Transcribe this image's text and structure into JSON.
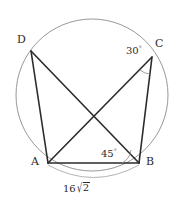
{
  "figure": {
    "stroke_color": "#2b2b2b",
    "circle_color": "#999999",
    "dimension_color": "#aaaaaa",
    "background": "#ffffff"
  },
  "vertices": {
    "a": {
      "label": "A",
      "x": 48,
      "y": 163,
      "label_x": 31,
      "label_y": 162
    },
    "b": {
      "label": "B",
      "x": 139,
      "y": 163,
      "label_x": 146,
      "label_y": 162
    },
    "c": {
      "label": "C",
      "x": 152,
      "y": 57,
      "label_x": 155,
      "label_y": 44
    },
    "d": {
      "label": "D",
      "x": 31,
      "y": 51,
      "label_x": 17,
      "label_y": 40
    }
  },
  "circle": {
    "cx": 92,
    "cy": 95,
    "r": 76
  },
  "angles": [
    {
      "name": "angle-at-c",
      "value": "30",
      "degree": "°",
      "vertex": "C",
      "label_x": 117,
      "label_y": 49
    },
    {
      "name": "angle-at-b",
      "value": "45",
      "degree": "°",
      "vertex": "B",
      "label_x": 108,
      "label_y": 152
    }
  ],
  "dimension": {
    "name": "segment-ab-length",
    "coefficient": "16",
    "radical": "√",
    "radicand": "2",
    "label_x": 66,
    "label_y": 188
  },
  "segments": [
    {
      "name": "side-ab",
      "from": "a",
      "to": "b"
    },
    {
      "name": "side-bc",
      "from": "b",
      "to": "c"
    },
    {
      "name": "side-da",
      "from": "d",
      "to": "a"
    },
    {
      "name": "diagonal-ac",
      "from": "a",
      "to": "c"
    },
    {
      "name": "diagonal-db",
      "from": "d",
      "to": "b"
    }
  ]
}
